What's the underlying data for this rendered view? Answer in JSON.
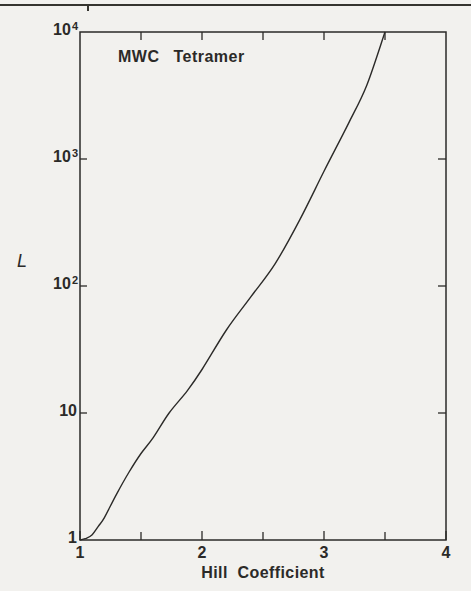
{
  "page": {
    "background": "#f2f1ee",
    "ink": "#2b2a28"
  },
  "figure": {
    "title": "MWC Tetramer",
    "y_axis_label": "L",
    "x_axis_label": "Hill Coefficient"
  },
  "chart_data": {
    "type": "line",
    "title": "MWC Tetramer",
    "xlabel": "Hill Coefficient",
    "ylabel": "L",
    "x_scale": "linear",
    "y_scale": "log",
    "xlim": [
      1,
      4
    ],
    "ylim": [
      1,
      10000
    ],
    "grid": false,
    "legend": false,
    "x_major_ticks": [
      1,
      2,
      3,
      4
    ],
    "x_tick_labels": [
      "1",
      "2",
      "3",
      "4"
    ],
    "x_minor_ticks": [
      1.5,
      2.5,
      3.5
    ],
    "top_axis_ticks": [
      1.5,
      2,
      2.5,
      3,
      3.5
    ],
    "y_left_ticks": [
      10,
      100,
      1000
    ],
    "y_right_ticks": [
      10,
      100,
      1000
    ],
    "y_tick_labels": [
      {
        "base": "10",
        "exp": "4",
        "value": 10000
      },
      {
        "base": "10",
        "exp": "3",
        "value": 1000
      },
      {
        "base": "10",
        "exp": "2",
        "value": 100
      },
      {
        "base": "10",
        "exp": "",
        "value": 10
      },
      {
        "base": "1",
        "exp": "",
        "value": 1
      }
    ],
    "series": [
      {
        "name": "L vs Hill coefficient (MWC tetramer)",
        "points": [
          [
            1.0,
            1.0
          ],
          [
            1.05,
            1.03
          ],
          [
            1.1,
            1.1
          ],
          [
            1.15,
            1.28
          ],
          [
            1.2,
            1.5
          ],
          [
            1.3,
            2.3
          ],
          [
            1.4,
            3.4
          ],
          [
            1.5,
            4.8
          ],
          [
            1.6,
            6.4
          ],
          [
            1.73,
            10
          ],
          [
            1.88,
            15
          ],
          [
            2.0,
            22
          ],
          [
            2.2,
            45
          ],
          [
            2.4,
            82
          ],
          [
            2.6,
            150
          ],
          [
            2.8,
            330
          ],
          [
            3.0,
            800
          ],
          [
            3.2,
            1900
          ],
          [
            3.35,
            3800
          ],
          [
            3.5,
            10000
          ]
        ]
      }
    ]
  }
}
